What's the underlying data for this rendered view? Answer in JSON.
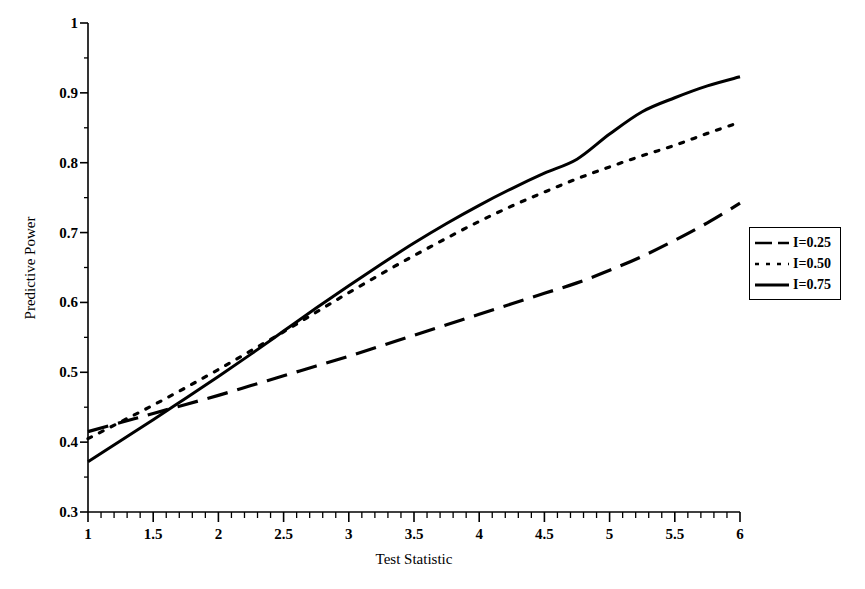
{
  "chart_data": {
    "type": "line",
    "title": "",
    "xlabel": "Test Statistic",
    "ylabel": "Predictive Power",
    "xlim": [
      1,
      6
    ],
    "ylim": [
      0.3,
      1
    ],
    "grid": false,
    "legend_position": "right",
    "x_ticks": [
      "1",
      "1.5",
      "2",
      "2.5",
      "3",
      "3.5",
      "4",
      "4.5",
      "5",
      "5.5",
      "6"
    ],
    "x_tick_values": [
      1,
      1.5,
      2,
      2.5,
      3,
      3.5,
      4,
      4.5,
      5,
      5.5,
      6
    ],
    "x_minor_tick_step": 0.1,
    "y_ticks": [
      "0.3",
      "0.4",
      "0.5",
      "0.6",
      "0.7",
      "0.8",
      "0.9",
      "1"
    ],
    "y_tick_values": [
      0.3,
      0.4,
      0.5,
      0.6,
      0.7,
      0.8,
      0.9,
      1
    ],
    "y_minor_tick_step": 0.05,
    "x": [
      1,
      1.25,
      1.5,
      1.75,
      2,
      2.25,
      2.5,
      2.75,
      3,
      3.25,
      3.5,
      3.75,
      4,
      4.25,
      4.5,
      4.75,
      5,
      5.25,
      5.5,
      5.75,
      6
    ],
    "series": [
      {
        "name": "I=0.25",
        "style": "dashed",
        "color": "#000000",
        "values": [
          0.415,
          0.428,
          0.441,
          0.454,
          0.467,
          0.481,
          0.495,
          0.509,
          0.523,
          0.538,
          0.553,
          0.568,
          0.583,
          0.598,
          0.613,
          0.628,
          0.646,
          0.666,
          0.689,
          0.714,
          0.742
        ]
      },
      {
        "name": "I=0.50",
        "style": "dotted",
        "color": "#000000",
        "values": [
          0.405,
          0.429,
          0.453,
          0.478,
          0.504,
          0.531,
          0.558,
          0.586,
          0.614,
          0.641,
          0.667,
          0.692,
          0.716,
          0.738,
          0.758,
          0.777,
          0.794,
          0.81,
          0.825,
          0.842,
          0.858
        ]
      },
      {
        "name": "I=0.75",
        "style": "solid",
        "color": "#000000",
        "values": [
          0.372,
          0.402,
          0.432,
          0.463,
          0.494,
          0.526,
          0.559,
          0.592,
          0.624,
          0.655,
          0.685,
          0.713,
          0.739,
          0.763,
          0.785,
          0.805,
          0.841,
          0.873,
          0.893,
          0.91,
          0.923
        ]
      }
    ]
  },
  "legend": {
    "entries": [
      {
        "label": "I=0.25",
        "style": "dashed"
      },
      {
        "label": "I=0.50",
        "style": "dotted"
      },
      {
        "label": "I=0.75",
        "style": "solid"
      }
    ]
  },
  "axes": {
    "x_title": "Test Statistic",
    "y_title": "Predictive Power"
  }
}
